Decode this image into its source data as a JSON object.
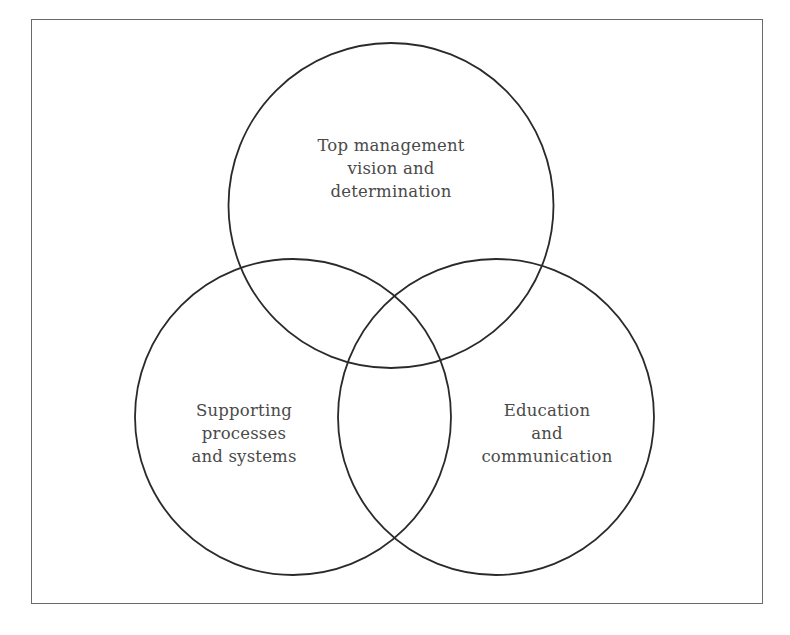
{
  "diagram": {
    "type": "venn",
    "frame": {
      "border_color": "#6a6a6a"
    },
    "stroke_color": "#2a2a2a",
    "text_color": "#4a4a4a",
    "circles": [
      {
        "id": "top",
        "cx": 391,
        "cy": 205,
        "r": 159,
        "label_lines": [
          "Top management",
          "vision and",
          "determination"
        ]
      },
      {
        "id": "left",
        "cx": 293,
        "cy": 417,
        "r": 162,
        "label_lines": [
          "Supporting",
          "processes",
          "and systems"
        ]
      },
      {
        "id": "right",
        "cx": 496,
        "cy": 417,
        "r": 158,
        "label_lines": [
          "Education",
          "and",
          "communication"
        ]
      }
    ]
  },
  "labels": {
    "top": {
      "line1": "Top management",
      "line2": "vision and",
      "line3": "determination"
    },
    "left": {
      "line1": "Supporting",
      "line2": "processes",
      "line3": "and systems"
    },
    "right": {
      "line1": "Education",
      "line2": "and",
      "line3": "communication"
    }
  },
  "caption": {
    "text": "",
    "note_visible": "cut off at bottom edge, illegible"
  }
}
